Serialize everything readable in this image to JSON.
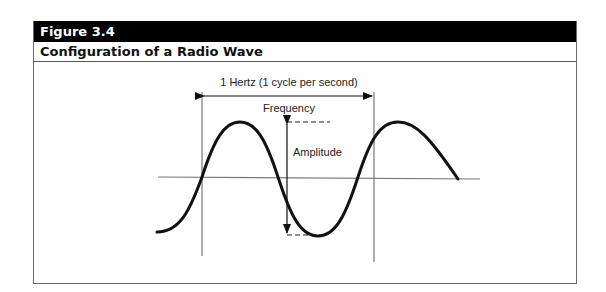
{
  "figure": {
    "number_label": "Figure 3.4",
    "title": "Configuration of a Radio Wave"
  },
  "diagram": {
    "labels": {
      "cycle": "1 Hertz (1 cycle per second)",
      "frequency": "Frequency",
      "amplitude": "Amplitude"
    },
    "colors": {
      "header_bg": "#000000",
      "wave": "#111111",
      "axis": "#777777"
    }
  }
}
